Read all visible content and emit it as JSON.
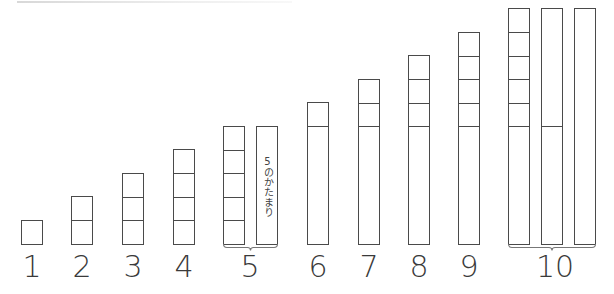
{
  "diagram": {
    "title": "",
    "cell": {
      "width": 22,
      "height": 23.5,
      "baseline_y": 243,
      "border_color": "#4a4a4a"
    },
    "label_color": "#3a3a3a",
    "five_block_text": "5のかたまり",
    "columns": [
      {
        "number": "1",
        "label_x": 12,
        "stacks": [
          {
            "x": 21,
            "units": [
              1
            ]
          }
        ]
      },
      {
        "number": "2",
        "label_x": 62,
        "stacks": [
          {
            "x": 71,
            "units": [
              1,
              1
            ]
          }
        ]
      },
      {
        "number": "3",
        "label_x": 113,
        "stacks": [
          {
            "x": 122,
            "units": [
              1,
              1,
              1
            ]
          }
        ]
      },
      {
        "number": "4",
        "label_x": 164,
        "stacks": [
          {
            "x": 173,
            "units": [
              1,
              1,
              1,
              1
            ]
          }
        ]
      },
      {
        "number": "5",
        "label_x": 230,
        "stacks": [
          {
            "x": 223,
            "units": [
              1,
              1,
              1,
              1,
              1
            ]
          },
          {
            "x": 256,
            "units": [
              5
            ],
            "text": "5のかたまり"
          }
        ],
        "brace": true
      },
      {
        "number": "6",
        "label_x": 298,
        "stacks": [
          {
            "x": 307,
            "units": [
              5,
              1
            ]
          }
        ]
      },
      {
        "number": "7",
        "label_x": 349,
        "stacks": [
          {
            "x": 358,
            "units": [
              5,
              1,
              1
            ]
          }
        ]
      },
      {
        "number": "8",
        "label_x": 399,
        "stacks": [
          {
            "x": 408,
            "units": [
              5,
              1,
              1,
              1
            ]
          }
        ]
      },
      {
        "number": "9",
        "label_x": 449,
        "stacks": [
          {
            "x": 458,
            "units": [
              5,
              1,
              1,
              1,
              1
            ]
          }
        ]
      },
      {
        "number": "10",
        "label_x": 535,
        "stacks": [
          {
            "x": 508,
            "units": [
              5,
              1,
              1,
              1,
              1,
              1
            ]
          },
          {
            "x": 541,
            "units": [
              5,
              5
            ]
          },
          {
            "x": 574,
            "units": [
              10
            ]
          }
        ],
        "brace": true
      }
    ]
  }
}
